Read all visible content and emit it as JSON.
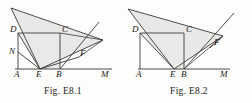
{
  "sheet": {
    "background_color": "#fdfdfc",
    "width": 252,
    "height": 103
  },
  "style": {
    "stroke_color": "#3a3a3a",
    "shade_fill": "#e8e8e6",
    "shade_stroke": "#9a9a9a",
    "label_color": "#1b1b1b"
  },
  "figures": [
    {
      "id": "fig-1",
      "caption": "Fig. E8.1",
      "points": {
        "A": {
          "label": "A",
          "x": 18,
          "y": 69
        },
        "B": {
          "label": "B",
          "x": 60,
          "y": 69
        },
        "C": {
          "label": "C",
          "x": 60,
          "y": 33
        },
        "D": {
          "label": "D",
          "x": 18,
          "y": 33
        },
        "E": {
          "label": "E",
          "x": 40,
          "y": 69
        },
        "F": {
          "label": "F",
          "x": 79,
          "y": 57
        },
        "N": {
          "label": "N",
          "x": 18,
          "y": 52
        },
        "M": {
          "label": "M",
          "x": 108,
          "y": 69
        },
        "P": {
          "label": "",
          "x": 11,
          "y": 8
        },
        "Q": {
          "label": "",
          "x": 103,
          "y": 40
        }
      },
      "label_positions": {
        "A": {
          "x": 14,
          "y": 77
        },
        "B": {
          "x": 56,
          "y": 77
        },
        "C": {
          "x": 62,
          "y": 32
        },
        "D": {
          "x": 11,
          "y": 32
        },
        "E": {
          "x": 36,
          "y": 77
        },
        "F": {
          "x": 80,
          "y": 56
        },
        "N": {
          "x": 10,
          "y": 53
        },
        "M": {
          "x": 101,
          "y": 77
        }
      }
    },
    {
      "id": "fig-2",
      "caption": "Fig. E8.2",
      "points": {
        "A": {
          "label": "A",
          "x": 14,
          "y": 69
        },
        "B": {
          "label": "B",
          "x": 58,
          "y": 69
        },
        "C": {
          "label": "C",
          "x": 58,
          "y": 33
        },
        "D": {
          "label": "D",
          "x": 14,
          "y": 33
        },
        "E": {
          "label": "E",
          "x": 48,
          "y": 69
        },
        "F": {
          "label": "F",
          "x": 88,
          "y": 44
        },
        "M": {
          "label": "M",
          "x": 98,
          "y": 69
        },
        "P": {
          "label": "",
          "x": 2,
          "y": 9
        },
        "Q": {
          "label": "",
          "x": 97,
          "y": 36
        }
      },
      "label_positions": {
        "A": {
          "x": 11,
          "y": 77
        },
        "B": {
          "x": 56,
          "y": 77
        },
        "C": {
          "x": 60,
          "y": 32
        },
        "D": {
          "x": 7,
          "y": 32
        },
        "E": {
          "x": 45,
          "y": 77
        },
        "F": {
          "x": 90,
          "y": 44
        },
        "M": {
          "x": 94,
          "y": 77
        }
      }
    }
  ]
}
